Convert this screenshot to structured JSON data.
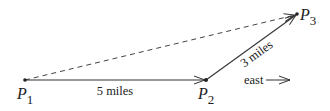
{
  "diagram": {
    "points": [
      {
        "id": "P1",
        "letter": "P",
        "sub": "1",
        "x": 25,
        "y": 80
      },
      {
        "id": "P2",
        "letter": "P",
        "sub": "2",
        "x": 206,
        "y": 80
      },
      {
        "id": "P3",
        "letter": "P",
        "sub": "3",
        "x": 297,
        "y": 14
      }
    ],
    "segments": [
      {
        "from": "P1",
        "to": "P2",
        "style": "solid",
        "arrow": true,
        "label": "5 miles"
      },
      {
        "from": "P2",
        "to": "P3",
        "style": "solid",
        "arrow": true,
        "label": "3 miles"
      },
      {
        "from": "P1",
        "to": "P3",
        "style": "dashed",
        "arrow": true,
        "label": ""
      }
    ],
    "direction_indicator": {
      "label": "east",
      "arrow": "right"
    },
    "colors": {
      "line": "#333333",
      "text": "#222222",
      "background": "#ffffff"
    }
  }
}
